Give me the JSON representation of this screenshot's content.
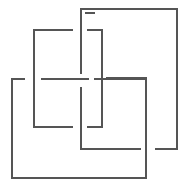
{
  "diagram": {
    "type": "line-figure",
    "width": 190,
    "height": 187,
    "stroke_color": "#555555",
    "stroke_width": 1.3,
    "background": "#ffffff",
    "segments": [
      {
        "name": "square-a-top-right-segment",
        "points": [
          [
            81,
            9
          ],
          [
            177,
            9
          ],
          [
            177,
            149
          ],
          [
            156,
            149
          ]
        ]
      },
      {
        "name": "square-a-left-upper",
        "points": [
          [
            81,
            9
          ],
          [
            81,
            73
          ]
        ]
      },
      {
        "name": "square-a-left-lower",
        "points": [
          [
            81,
            88
          ],
          [
            81,
            149
          ],
          [
            140,
            149
          ]
        ]
      },
      {
        "name": "square-a-top-stub",
        "points": [
          [
            86,
            13
          ],
          [
            94,
            13
          ]
        ]
      },
      {
        "name": "square-b-top",
        "points": [
          [
            72,
            30
          ],
          [
            34,
            30
          ],
          [
            34,
            127
          ],
          [
            72,
            127
          ]
        ]
      },
      {
        "name": "square-b-top-right",
        "points": [
          [
            88,
            30
          ],
          [
            102,
            30
          ],
          [
            102,
            127
          ],
          [
            88,
            127
          ]
        ]
      },
      {
        "name": "square-c-top-left",
        "points": [
          [
            42,
            79
          ],
          [
            88,
            79
          ]
        ]
      },
      {
        "name": "square-c-top-right",
        "points": [
          [
            95,
            79
          ],
          [
            146,
            79
          ],
          [
            146,
            178
          ],
          [
            12,
            178
          ],
          [
            12,
            79
          ],
          [
            24,
            79
          ]
        ]
      },
      {
        "name": "square-d-inner",
        "points": [
          [
            107,
            78
          ],
          [
            146,
            78
          ]
        ]
      },
      {
        "name": "square-d-right",
        "points": [
          [
            146,
            78
          ],
          [
            146,
            153
          ]
        ]
      }
    ]
  }
}
